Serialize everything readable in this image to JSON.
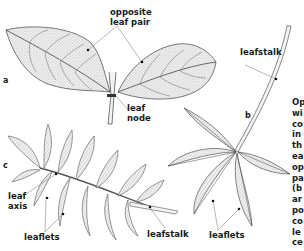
{
  "diagram": {
    "panels": {
      "a": {
        "letter": "a",
        "labels": {
          "opposite_leaf_pair_1": "opposite",
          "opposite_leaf_pair_2": "leaf pair",
          "leaf_node_1": "leaf",
          "leaf_node_2": "node"
        }
      },
      "b": {
        "letter": "b",
        "labels": {
          "leafstalk": "leafstalk",
          "leaflets": "leaflets"
        }
      },
      "c": {
        "letter": "c",
        "labels": {
          "leaf_axis_1": "leaf",
          "leaf_axis_2": "axis",
          "leaflets": "leaflets",
          "leafstalk": "leafstalk"
        }
      }
    },
    "side_text_lines": [
      "Op",
      "wi",
      "co",
      "in",
      "th",
      "ea",
      "op",
      "pa",
      "(b",
      "ar",
      "po",
      "co",
      "le",
      "ce"
    ],
    "colors": {
      "ink": "#1a1a1a",
      "leaf_fill": "#e6e6e6",
      "leaf_stroke": "#555555",
      "pointer": "#888888",
      "background": "#ffffff"
    }
  }
}
